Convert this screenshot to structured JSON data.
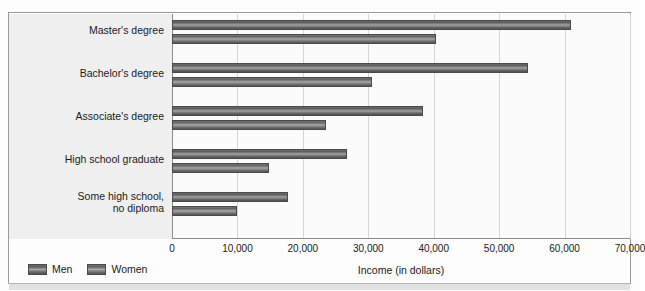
{
  "top_caption": "",
  "chart_data": {
    "type": "bar",
    "orientation": "horizontal",
    "title": "",
    "xlabel": "Income (in dollars)",
    "ylabel": "",
    "xlim": [
      0,
      70000
    ],
    "xticks": [
      0,
      10000,
      20000,
      30000,
      40000,
      50000,
      60000,
      70000
    ],
    "xtick_labels": [
      "0",
      "10,000",
      "20,000",
      "30,000",
      "40,000",
      "50,000",
      "60,000",
      "70,000"
    ],
    "grid": true,
    "legend_position": "bottom-left",
    "categories": [
      "Master's degree",
      "Bachelor's degree",
      "Associate's degree",
      "High school graduate",
      "Some high school,\nno diploma"
    ],
    "series": [
      {
        "name": "Men",
        "color": "#6e6e6e",
        "values": [
          61000,
          54400,
          38400,
          26700,
          17700
        ]
      },
      {
        "name": "Women",
        "color": "#8a8a8a",
        "values": [
          40300,
          30600,
          23600,
          14900,
          10000
        ]
      }
    ]
  },
  "legend": {
    "items": [
      {
        "label": "Men",
        "swatch": "men"
      },
      {
        "label": "Women",
        "swatch": "women"
      }
    ]
  },
  "axis": {
    "x_title": "Income (in dollars)"
  }
}
